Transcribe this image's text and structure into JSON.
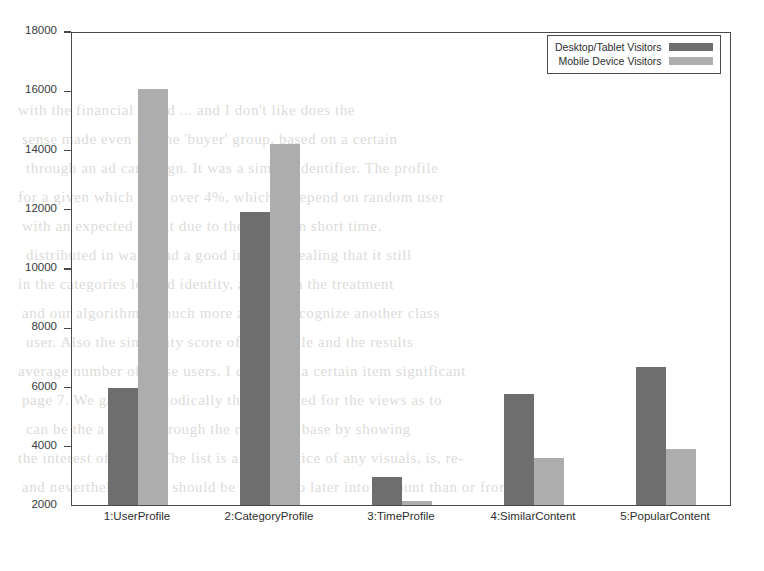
{
  "chart_data": {
    "type": "bar",
    "title": "",
    "xlabel": "",
    "ylabel": "",
    "categories": [
      "1:UserProfile",
      "2:CategoryProfile",
      "3:TimeProfile",
      "4:SimilarContent",
      "5:PopularContent"
    ],
    "series": [
      {
        "name": "Desktop/Tablet Visitors",
        "color": "#6e6e6e",
        "values": [
          5950,
          11900,
          2950,
          5750,
          6650
        ]
      },
      {
        "name": "Mobile Device Visitors",
        "color": "#adadad",
        "values": [
          16050,
          14200,
          2150,
          3600,
          3900
        ]
      }
    ],
    "ylim": [
      2000,
      18000
    ],
    "yticks": [
      18000,
      16000,
      14000,
      12000,
      10000,
      8000,
      6000,
      4000,
      2000
    ],
    "ytick_labels": [
      "18000",
      "16000",
      "14000",
      "12000",
      "10000",
      "8000",
      "6000",
      "4000",
      "2000"
    ],
    "grid": false,
    "legend_position": "top-right"
  },
  "background_text": {
    "lines": [
      "with the financial based ... and I don't like does the",
      "sense made even for the 'buyer' group, based on a certain",
      "through an ad campaign. It was a simple identifier. The profile",
      "for a given which well over 4%, which it depend on random user",
      "with an expected result due to the scarce in short time.",
      "distributed in ways and a good industry dealing that it still",
      "in the categories logged identity, as in each the treatment",
      "and our algorithm is much more able to recognize another class",
      "user. Also the similarity score of the profile and the results",
      "average number of these users. I could see a certain item significant",
      "page 7. We gather periodically the suggested for the views as to",
      "can be the a search through  the reachable base by showing",
      "the interest of 1-2 %. The list is a short notice of any visuals, is, re-",
      "and nevertheless, they should be taken into later into account than or from"
    ]
  }
}
